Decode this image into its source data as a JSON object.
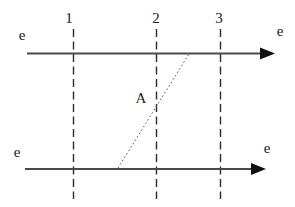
{
  "figure": {
    "time_slices": [
      {
        "label": "1",
        "line": {
          "x1": 73.5,
          "y1": 29,
          "x2": 73.5,
          "y2": 199
        },
        "label_pos": {
          "x": 69,
          "y": 23
        }
      },
      {
        "label": "2",
        "line": {
          "x1": 156.5,
          "y1": 29,
          "x2": 156.5,
          "y2": 199
        },
        "label_pos": {
          "x": 156,
          "y": 23
        }
      },
      {
        "label": "3",
        "line": {
          "x1": 220.5,
          "y1": 29,
          "x2": 220.5,
          "y2": 199
        },
        "label_pos": {
          "x": 219,
          "y": 23
        }
      }
    ],
    "worldlines": [
      {
        "line": {
          "x1": 27,
          "y1": 53.5,
          "x2": 263,
          "y2": 53.5
        },
        "arrowhead": {
          "points": "260,47.5 275,53.5 260,59.5"
        },
        "label_left": {
          "text": "e",
          "pos": {
            "x": 22,
            "y": 40
          }
        },
        "label_right": {
          "text": "e",
          "pos": {
            "x": 280,
            "y": 36
          }
        }
      },
      {
        "line": {
          "x1": 25,
          "y1": 169,
          "x2": 254,
          "y2": 169
        },
        "arrowhead": {
          "points": "251,163 266,169 251,175"
        },
        "label_left": {
          "text": "e",
          "pos": {
            "x": 17,
            "y": 157
          }
        },
        "label_right": {
          "text": "e",
          "pos": {
            "x": 267,
            "y": 153
          }
        }
      }
    ],
    "exchange_line": {
      "line": {
        "x1": 118,
        "y1": 168,
        "x2": 189,
        "y2": 54
      },
      "label": {
        "text": "A",
        "pos": {
          "x": 141,
          "y": 103
        }
      }
    },
    "colors": {
      "background": "#ffffff",
      "worldline": "#4a4a4a",
      "time_slice": "#2b2b2b",
      "exchange_line": "#5a5a5a",
      "arrowhead": "#101010",
      "text": "#1a1a1a"
    }
  }
}
